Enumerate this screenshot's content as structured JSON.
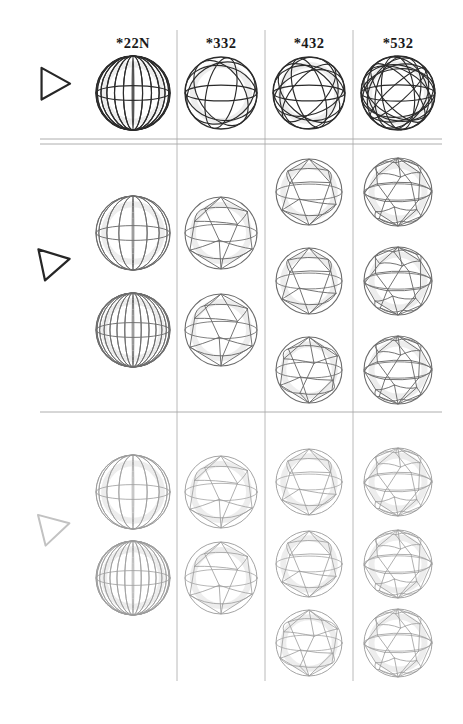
{
  "figure": {
    "kind": "symmetry-group-sphere-table",
    "background_color": "#ffffff",
    "ink_colors": {
      "dark": "#2b2b2b",
      "medium": "#6d6d6d",
      "light": "#9c9c9c",
      "ghost": "#dedede",
      "rule": "#9a9a9a"
    },
    "columns": [
      {
        "id": "col-22N",
        "label": "*22N",
        "x_center": 133
      },
      {
        "id": "col-332",
        "label": "*332",
        "x_center": 221
      },
      {
        "id": "col-432",
        "label": "*432",
        "x_center": 309
      },
      {
        "id": "col-532",
        "label": "*532",
        "x_center": 398
      }
    ],
    "column_dividers_x": [
      177,
      265,
      353
    ],
    "divider_top_y": 30,
    "divider_bottom_y": 681,
    "header_baseline_y": 48,
    "row_rules": [
      {
        "id": "rule-double-upper",
        "y": 139,
        "style": "double-top"
      },
      {
        "id": "rule-double-lower",
        "y": 144,
        "style": "double-bottom"
      },
      {
        "id": "rule-single",
        "y": 412,
        "style": "single"
      }
    ],
    "rows": [
      {
        "id": "row-1",
        "marker": {
          "name": "triangle-marker",
          "tone": "dark",
          "cx": 52,
          "cy": 84,
          "rotation": 0
        },
        "cells": [
          {
            "column": "*22N",
            "tone": "dark",
            "motif": "meridians-equator",
            "spheres": [
              {
                "cx": 133,
                "cy": 93,
                "r": 37,
                "motif": "meridian-globe",
                "meridians": 12,
                "parallels": 1
              }
            ]
          },
          {
            "column": "*332",
            "tone": "dark",
            "motif": "tetrahedral-great-circles",
            "spheres": [
              {
                "cx": 221,
                "cy": 93,
                "r": 36,
                "motif": "great-circles",
                "circles": 4
              }
            ]
          },
          {
            "column": "*432",
            "tone": "dark",
            "motif": "octahedral-great-circles",
            "spheres": [
              {
                "cx": 309,
                "cy": 93,
                "r": 36,
                "motif": "great-circles",
                "circles": 6
              }
            ]
          },
          {
            "column": "*532",
            "tone": "dark",
            "motif": "icosahedral-great-circles",
            "spheres": [
              {
                "cx": 398,
                "cy": 93,
                "r": 37,
                "motif": "great-circles",
                "circles": 10
              }
            ]
          }
        ]
      },
      {
        "id": "row-2",
        "marker": {
          "name": "triangle-marker",
          "tone": "dark",
          "cx": 52,
          "cy": 263,
          "rotation": -12
        },
        "cells": [
          {
            "column": "*22N",
            "tone": "mid",
            "motif": "prism-antiprism",
            "spheres": [
              {
                "cx": 133,
                "cy": 233,
                "r": 37,
                "motif": "meridian-globe",
                "meridians": 8,
                "parallels": 1
              },
              {
                "cx": 133,
                "cy": 330,
                "r": 37,
                "motif": "meridian-globe",
                "meridians": 14,
                "parallels": 1
              }
            ]
          },
          {
            "column": "*332",
            "tone": "mid",
            "motif": "tetrahedral-tilings",
            "spheres": [
              {
                "cx": 221,
                "cy": 233,
                "r": 36,
                "motif": "spherical-tiling",
                "faces": 4
              },
              {
                "cx": 221,
                "cy": 330,
                "r": 36,
                "motif": "spherical-tiling",
                "faces": 4
              }
            ]
          },
          {
            "column": "*432",
            "tone": "mid",
            "motif": "octahedral-tilings",
            "spheres": [
              {
                "cx": 309,
                "cy": 192,
                "r": 33,
                "motif": "spherical-tiling",
                "faces": 6
              },
              {
                "cx": 309,
                "cy": 281,
                "r": 33,
                "motif": "spherical-tiling",
                "faces": 6
              },
              {
                "cx": 309,
                "cy": 370,
                "r": 33,
                "motif": "spherical-tiling",
                "faces": 8
              }
            ]
          },
          {
            "column": "*532",
            "tone": "mid",
            "motif": "icosahedral-tilings",
            "spheres": [
              {
                "cx": 398,
                "cy": 192,
                "r": 34,
                "motif": "spherical-tiling",
                "faces": 12
              },
              {
                "cx": 398,
                "cy": 281,
                "r": 34,
                "motif": "spherical-tiling",
                "faces": 20
              },
              {
                "cx": 398,
                "cy": 370,
                "r": 34,
                "motif": "spherical-tiling",
                "faces": 12
              }
            ]
          }
        ]
      },
      {
        "id": "row-3",
        "marker": {
          "name": "triangle-marker",
          "tone": "light",
          "cx": 52,
          "cy": 528,
          "rotation": -14
        },
        "cells": [
          {
            "column": "*22N",
            "tone": "light",
            "motif": "prism-antiprism",
            "spheres": [
              {
                "cx": 133,
                "cy": 492,
                "r": 37,
                "motif": "meridian-globe",
                "meridians": 8,
                "parallels": 1
              },
              {
                "cx": 133,
                "cy": 578,
                "r": 37,
                "motif": "meridian-globe",
                "meridians": 14,
                "parallels": 1
              }
            ]
          },
          {
            "column": "*332",
            "tone": "light",
            "motif": "tetrahedral-tilings",
            "spheres": [
              {
                "cx": 221,
                "cy": 492,
                "r": 36,
                "motif": "spherical-tiling",
                "faces": 4
              },
              {
                "cx": 221,
                "cy": 578,
                "r": 36,
                "motif": "spherical-tiling",
                "faces": 4
              }
            ]
          },
          {
            "column": "*432",
            "tone": "light",
            "motif": "octahedral-tilings",
            "spheres": [
              {
                "cx": 309,
                "cy": 482,
                "r": 33,
                "motif": "spherical-tiling",
                "faces": 6
              },
              {
                "cx": 309,
                "cy": 564,
                "r": 33,
                "motif": "spherical-tiling",
                "faces": 6
              },
              {
                "cx": 309,
                "cy": 643,
                "r": 33,
                "motif": "spherical-tiling",
                "faces": 8
              }
            ]
          },
          {
            "column": "*532",
            "tone": "light",
            "motif": "icosahedral-tilings",
            "spheres": [
              {
                "cx": 398,
                "cy": 482,
                "r": 34,
                "motif": "spherical-tiling",
                "faces": 12
              },
              {
                "cx": 398,
                "cy": 564,
                "r": 34,
                "motif": "spherical-tiling",
                "faces": 12
              },
              {
                "cx": 398,
                "cy": 643,
                "r": 34,
                "motif": "spherical-tiling",
                "faces": 12
              }
            ]
          }
        ]
      }
    ]
  }
}
